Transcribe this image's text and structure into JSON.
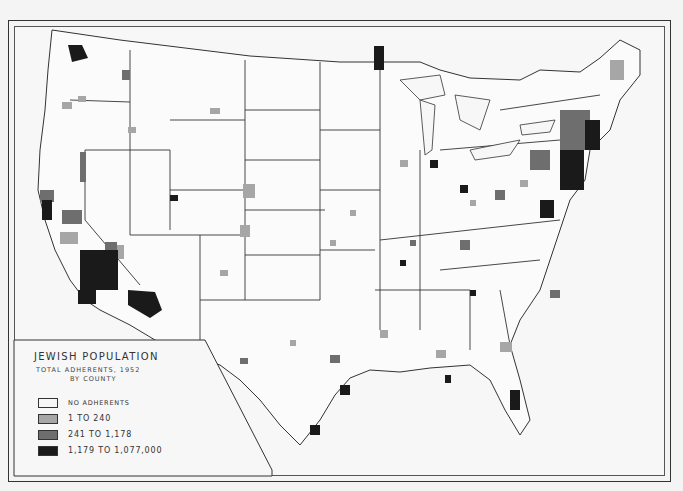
{
  "map": {
    "subject": "Jewish population by county, United States",
    "colors": {
      "background": "#f7f7f7",
      "border": "#333333",
      "county_line": "#555555"
    }
  },
  "legend": {
    "title": "JEWISH POPULATION",
    "subtitle": "TOTAL ADHERENTS, 1952",
    "subtitle2": "BY COUNTY",
    "items": [
      {
        "label": "NO ADHERENTS",
        "color": "#f7f7f7"
      },
      {
        "label": "1 TO 240",
        "color": "#a6a6a6"
      },
      {
        "label": "241 TO 1,178",
        "color": "#6e6e6e"
      },
      {
        "label": "1,179 TO 1,077,000",
        "color": "#1a1a1a"
      }
    ]
  }
}
